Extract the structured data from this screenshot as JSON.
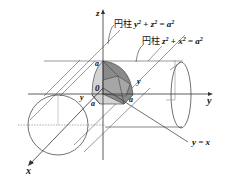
{
  "diagram": {
    "axes": {
      "x_label": "x",
      "y_label": "y",
      "z_label": "z",
      "origin_label": "0"
    },
    "cylinder_1": {
      "prefix": "円柱",
      "equation_parts": [
        "y",
        "2",
        " + ",
        "z",
        "2",
        " = ",
        "a",
        "2"
      ]
    },
    "cylinder_2": {
      "prefix": "円柱",
      "equation_parts": [
        "z",
        "2",
        " + ",
        "x",
        "2",
        " = ",
        "a",
        "2"
      ]
    },
    "plane_label": "y = x",
    "point_labels": {
      "a_top": "a",
      "a_right": "a",
      "a_left": "a",
      "y_small_left": "y",
      "y_small_right": "y"
    },
    "colors": {
      "line": "#333333",
      "light_gray": "#b0b0b0",
      "shade_dark": "#8a8a8a",
      "shade_light": "#d4d4d4"
    }
  }
}
